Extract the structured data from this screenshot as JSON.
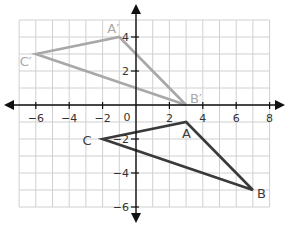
{
  "diagram": {
    "type": "coordinate-plane-transformation",
    "grid": {
      "x_min": -7,
      "x_max": 8,
      "y_min": -6,
      "y_max": 5,
      "color": "#d0d0d0"
    },
    "axes": {
      "x_ticks": [
        {
          "value": -6,
          "label": "−6"
        },
        {
          "value": -4,
          "label": "−4"
        },
        {
          "value": -2,
          "label": "−2"
        },
        {
          "value": 2,
          "label": "2"
        },
        {
          "value": 4,
          "label": "4"
        },
        {
          "value": 6,
          "label": "6"
        },
        {
          "value": 8,
          "label": "8"
        }
      ],
      "y_ticks": [
        {
          "value": 4,
          "label": "4"
        },
        {
          "value": 2,
          "label": "2"
        },
        {
          "value": -2,
          "label": "−2"
        },
        {
          "value": -4,
          "label": "−4"
        },
        {
          "value": -6,
          "label": "−6"
        }
      ],
      "origin_label": "0",
      "color": "#111111"
    },
    "triangles": [
      {
        "name": "ABC",
        "color": "#3a3a3a",
        "vertices": [
          {
            "label": "A",
            "x": 3,
            "y": -1
          },
          {
            "label": "B",
            "x": 7,
            "y": -5
          },
          {
            "label": "C",
            "x": -2,
            "y": -2
          }
        ]
      },
      {
        "name": "A'B'C'",
        "color": "#a8a8a8",
        "vertices": [
          {
            "label": "A′",
            "x": -1,
            "y": 4
          },
          {
            "label": "B′",
            "x": 3,
            "y": 0
          },
          {
            "label": "C′",
            "x": -6,
            "y": 3
          }
        ]
      }
    ]
  }
}
